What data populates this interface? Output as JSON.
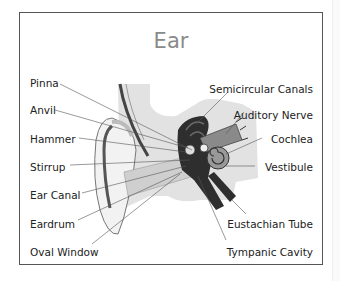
{
  "diagram": {
    "title": "Ear",
    "labels_left": [
      {
        "text": "Pinna",
        "y": 79
      },
      {
        "text": "Anvil",
        "y": 107
      },
      {
        "text": "Hammer",
        "y": 135
      },
      {
        "text": "Stirrup",
        "y": 164
      },
      {
        "text": "Ear Canal",
        "y": 192
      },
      {
        "text": "Eardrum",
        "y": 220
      },
      {
        "text": "Oval Window",
        "y": 248
      }
    ],
    "labels_right": [
      {
        "text": "Semicircular Canals",
        "y": 89
      },
      {
        "text": "Auditory Nerve",
        "y": 108
      },
      {
        "text": "Cochlea",
        "y": 135
      },
      {
        "text": "Vestibule",
        "y": 164
      },
      {
        "text": "Eustachian Tube",
        "y": 220
      },
      {
        "text": "Tympanic Cavity",
        "y": 248
      }
    ],
    "colors": {
      "title": "#8a8a8a",
      "frame": "#555555",
      "background_tissue": "#e2e2e2",
      "skin_light": "#f0f0f0",
      "skin_shade": "#a8a8a8",
      "inner_dark": "#2e2e2e",
      "inner_mid": "#7a7a7a"
    }
  }
}
